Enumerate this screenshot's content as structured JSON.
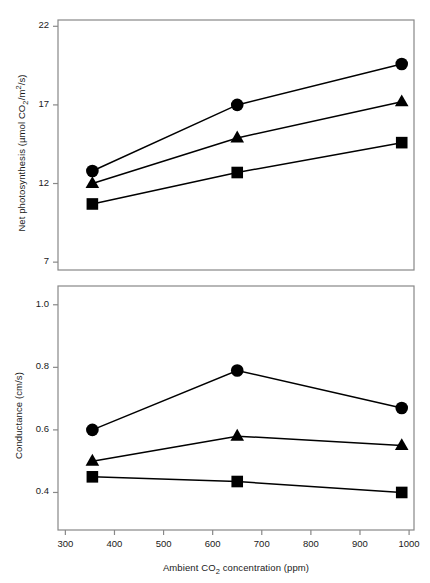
{
  "figure": {
    "width": 430,
    "height": 583,
    "background": "#ffffff",
    "line_color": "#000000",
    "marker_color": "#000000",
    "frame_color": "#888888"
  },
  "xaxis": {
    "label_prefix": "Ambient CO",
    "label_sub": "2",
    "label_suffix": " concentration (ppm)",
    "ticks": [
      300,
      400,
      500,
      600,
      700,
      800,
      900,
      1000
    ],
    "tick_labels": [
      "300",
      "400",
      "500",
      "600",
      "700",
      "800",
      "900",
      "1000"
    ],
    "min": 285,
    "max": 1010
  },
  "panels": [
    {
      "id": "net-photosynthesis",
      "ylabel_prefix": "Net photosynthesis (µmol CO",
      "ylabel_sub": "2",
      "ylabel_mid": "/m",
      "ylabel_sup": "2",
      "ylabel_suffix": "/s)",
      "ticks": [
        7,
        12,
        17,
        22
      ],
      "tick_labels": [
        "7",
        "12",
        "17",
        "22"
      ],
      "min": 6.5,
      "max": 22.4
    },
    {
      "id": "conductance",
      "ylabel_prefix": "Conductance (cm/s)",
      "ylabel_sub": "",
      "ylabel_mid": "",
      "ylabel_sup": "",
      "ylabel_suffix": "",
      "ticks": [
        0.4,
        0.6,
        0.8,
        1.0
      ],
      "tick_labels": [
        "0.4",
        "0.6",
        "0.8",
        "1.0"
      ],
      "min": 0.28,
      "max": 1.06
    }
  ],
  "chart_data": [
    {
      "type": "line",
      "title": "",
      "xlabel": "Ambient CO2 concentration (ppm)",
      "ylabel": "Net photosynthesis (µmol CO2/m2/s)",
      "x": [
        355,
        650,
        985
      ],
      "xlim": [
        285,
        1010
      ],
      "ylim": [
        6.5,
        22.4
      ],
      "grid": false,
      "legend": "none",
      "series": [
        {
          "name": "circle",
          "marker": "circle",
          "values": [
            12.8,
            17.0,
            19.6
          ]
        },
        {
          "name": "triangle",
          "marker": "triangle",
          "values": [
            12.0,
            14.9,
            17.2
          ]
        },
        {
          "name": "square",
          "marker": "square",
          "values": [
            10.7,
            12.7,
            14.6
          ]
        }
      ]
    },
    {
      "type": "line",
      "title": "",
      "xlabel": "Ambient CO2 concentration (ppm)",
      "ylabel": "Conductance (cm/s)",
      "x": [
        355,
        650,
        985
      ],
      "xlim": [
        285,
        1010
      ],
      "ylim": [
        0.28,
        1.06
      ],
      "grid": false,
      "legend": "none",
      "series": [
        {
          "name": "circle",
          "marker": "circle",
          "values": [
            0.6,
            0.79,
            0.67
          ]
        },
        {
          "name": "triangle",
          "marker": "triangle",
          "values": [
            0.5,
            0.58,
            0.55
          ]
        },
        {
          "name": "square",
          "marker": "square",
          "values": [
            0.45,
            0.435,
            0.4
          ]
        }
      ]
    }
  ]
}
